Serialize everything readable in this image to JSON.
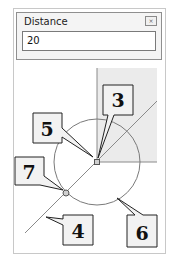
{
  "dialog": {
    "title": "Distance",
    "close_icon": "close-icon",
    "input_value": "20"
  },
  "diagram": {
    "callouts": [
      {
        "label": "3",
        "target": "center-point"
      },
      {
        "label": "5",
        "target": "center-point"
      },
      {
        "label": "7",
        "target": "intersection-point"
      },
      {
        "label": "4",
        "target": "diagonal-line"
      },
      {
        "label": "6",
        "target": "circle"
      }
    ],
    "colors": {
      "shaded_region": "#ebebeb",
      "line": "#8a8a8a",
      "callout_fill": "#f2f2f2"
    }
  }
}
